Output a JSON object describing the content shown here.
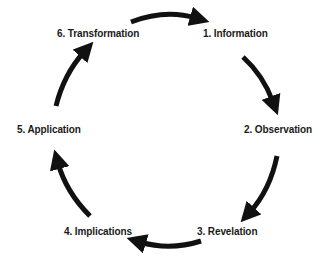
{
  "diagram": {
    "type": "cycle",
    "background": "#ffffff",
    "text_color": "#1a1a1a",
    "arrow_color": "#111111",
    "steps": [
      {
        "label": "1. Information",
        "x": 203,
        "y": 28
      },
      {
        "label": "2. Observation",
        "x": 244,
        "y": 124
      },
      {
        "label": "3. Revelation",
        "x": 197,
        "y": 226
      },
      {
        "label": "4. Implications",
        "x": 64,
        "y": 226
      },
      {
        "label": "5. Application",
        "x": 17,
        "y": 124
      },
      {
        "label": "6. Transformation",
        "x": 57,
        "y": 28
      }
    ],
    "arrows": [
      {
        "from": "6. Transformation",
        "to": "1. Information"
      },
      {
        "from": "1. Information",
        "to": "2. Observation"
      },
      {
        "from": "2. Observation",
        "to": "3. Revelation"
      },
      {
        "from": "3. Revelation",
        "to": "4. Implications"
      },
      {
        "from": "4. Implications",
        "to": "5. Application"
      },
      {
        "from": "5. Application",
        "to": "6. Transformation"
      }
    ]
  }
}
